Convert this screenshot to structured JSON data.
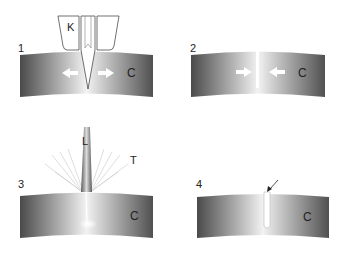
{
  "diagram": {
    "panels": [
      {
        "number": "1",
        "tool_label": "K",
        "material_label": "C"
      },
      {
        "number": "2",
        "material_label": "C"
      },
      {
        "number": "3",
        "beam_label": "L",
        "rays_label": "T",
        "material_label": "C"
      },
      {
        "number": "4",
        "material_label": "C"
      }
    ]
  },
  "colors": {
    "background": "#ffffff",
    "material_dark": "#4a4a4a",
    "material_light": "#f4f4f4",
    "outline": "#333333"
  }
}
